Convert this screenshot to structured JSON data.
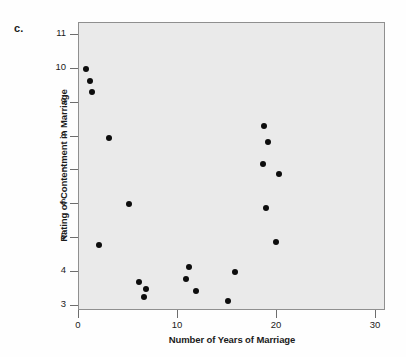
{
  "figure": {
    "panel_label": "c.",
    "background_color": "#fefefe",
    "plot_background_color": "#eaeaea",
    "frame_color": "#8f8f8f",
    "marker_color": "#0d0d0d"
  },
  "chart_data": {
    "type": "scatter",
    "title": "",
    "xlabel": "Number of Years of Marriage",
    "ylabel": "Rating of Contentment in Marriage",
    "xlim": [
      0,
      31
    ],
    "ylim": [
      2.85,
      11.35
    ],
    "xticks": [
      0,
      10,
      20,
      30
    ],
    "xtick_labels": [
      "0",
      "10",
      "20",
      "30"
    ],
    "yticks": [
      3,
      4,
      5,
      6,
      7,
      8,
      9,
      10,
      11
    ],
    "ytick_labels": [
      "3",
      "4",
      "5",
      "6",
      "7",
      "8",
      "9",
      "10",
      "11"
    ],
    "grid": false,
    "legend": false,
    "points": [
      {
        "x": 0.7,
        "y": 10.0
      },
      {
        "x": 1.1,
        "y": 9.65
      },
      {
        "x": 1.3,
        "y": 9.3
      },
      {
        "x": 3.0,
        "y": 7.95
      },
      {
        "x": 2.0,
        "y": 4.8
      },
      {
        "x": 5.0,
        "y": 6.0
      },
      {
        "x": 6.1,
        "y": 3.7
      },
      {
        "x": 6.8,
        "y": 3.5
      },
      {
        "x": 6.6,
        "y": 3.25
      },
      {
        "x": 10.8,
        "y": 3.8
      },
      {
        "x": 11.1,
        "y": 4.15
      },
      {
        "x": 11.8,
        "y": 3.45
      },
      {
        "x": 15.0,
        "y": 3.15
      },
      {
        "x": 15.8,
        "y": 4.0
      },
      {
        "x": 18.7,
        "y": 8.3
      },
      {
        "x": 19.1,
        "y": 7.85
      },
      {
        "x": 18.6,
        "y": 7.2
      },
      {
        "x": 20.2,
        "y": 6.9
      },
      {
        "x": 18.9,
        "y": 5.9
      },
      {
        "x": 19.9,
        "y": 4.9
      }
    ]
  }
}
